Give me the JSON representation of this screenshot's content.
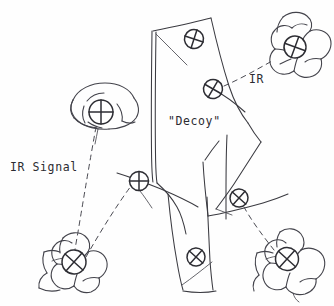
{
  "figure": {
    "kind": "hand-drawn-sketch",
    "background_color": "#fefefe",
    "ink_color": "#3a3a40",
    "marker_color": "#2e2e34"
  },
  "labels": [
    {
      "id": "ir-signal",
      "text": "IR Signal",
      "x": 10,
      "y": 171,
      "size": "normal"
    },
    {
      "id": "decoy",
      "text": "\"Decoy\"",
      "x": 168,
      "y": 125,
      "size": "normal"
    },
    {
      "id": "ir",
      "text": "IR",
      "x": 249,
      "y": 83,
      "size": "normal"
    }
  ],
  "aircraft": [
    {
      "id": "aircraft-top-right",
      "position": "top-right",
      "marker_x": 295,
      "marker_y": 47
    },
    {
      "id": "aircraft-mid-left",
      "position": "mid-left",
      "marker_x": 101,
      "marker_y": 112
    },
    {
      "id": "aircraft-bottom-left",
      "position": "bottom-left",
      "marker_x": 74,
      "marker_y": 262
    },
    {
      "id": "aircraft-bottom-right",
      "position": "bottom-right",
      "marker_x": 287,
      "marker_y": 259
    }
  ],
  "decoy_markers": [
    {
      "id": "decoy-marker-upper",
      "x": 194,
      "y": 39,
      "rotation": 18
    },
    {
      "id": "decoy-marker-mid",
      "x": 213,
      "y": 89,
      "rotation": 30
    },
    {
      "id": "decoy-marker-left-wing",
      "x": 139,
      "y": 181,
      "rotation": 0
    },
    {
      "id": "decoy-marker-right-wing",
      "x": 239,
      "y": 198,
      "rotation": 42
    },
    {
      "id": "decoy-marker-lower",
      "x": 196,
      "y": 257,
      "rotation": 42
    }
  ],
  "signal_lines": [
    {
      "id": "ir-line-top-right",
      "from": "decoy-marker-mid",
      "to": "aircraft-top-right",
      "style": "dashed"
    },
    {
      "id": "ir-line-mid-left",
      "from": "aircraft-mid-left",
      "to": "aircraft-bottom-left",
      "style": "dashed"
    },
    {
      "id": "ir-line-bottom-left",
      "from": "aircraft-bottom-left",
      "to": "decoy-marker-left-wing",
      "style": "dashed"
    },
    {
      "id": "ir-line-bottom-right",
      "from": "aircraft-bottom-right",
      "to": "decoy-marker-right-wing",
      "style": "dashed"
    }
  ]
}
